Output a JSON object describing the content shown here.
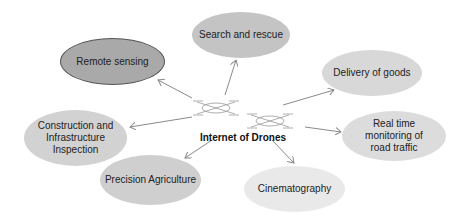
{
  "diagram": {
    "center": {
      "label": "Internet of Drones",
      "icon": "drone-icon"
    },
    "nodes": [
      {
        "id": "remote",
        "label": "Remote sensing",
        "fill": "#a9a9a9"
      },
      {
        "id": "search",
        "label": "Search and rescue",
        "fill": "#c4c4c4"
      },
      {
        "id": "delivery",
        "label": "Delivery of goods",
        "fill": "#d8d8d8"
      },
      {
        "id": "construct",
        "label": "Construction and Infrastructure Inspection",
        "fill": "#d2d2d2"
      },
      {
        "id": "realtime",
        "label": "Real time monitoring of road traffic",
        "fill": "#dcdcdc"
      },
      {
        "id": "precision",
        "label": "Precision Agriculture",
        "fill": "#cfcfcf"
      },
      {
        "id": "cinema",
        "label": "Cinematography",
        "fill": "#e9e9e9"
      }
    ],
    "edge_color": "#8a8a8a"
  }
}
